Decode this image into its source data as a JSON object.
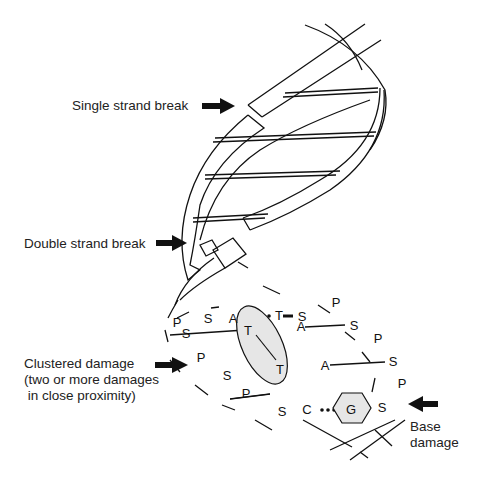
{
  "labels": {
    "single_strand_break": "Single strand break",
    "double_strand_break": "Double strand break",
    "clustered_damage_1": "Clustered damage",
    "clustered_damage_2": "(two or more damages",
    "clustered_damage_3": " in close proximity)",
    "base_damage_1": "Base",
    "base_damage_2": "damage"
  },
  "nucleotides": {
    "top_row": [
      "P",
      "S",
      "A",
      "T",
      "S"
    ],
    "right_strand": [
      "P",
      "S",
      "P",
      "S",
      "P",
      "S"
    ],
    "left_strand": [
      "S",
      "P",
      "S",
      "P",
      "S"
    ],
    "pairs": [
      "A",
      "A",
      "T",
      "T",
      "C",
      "G"
    ]
  },
  "colors": {
    "line": "#111111",
    "lesion_fill": "#e6e6e6",
    "background": "#ffffff"
  }
}
